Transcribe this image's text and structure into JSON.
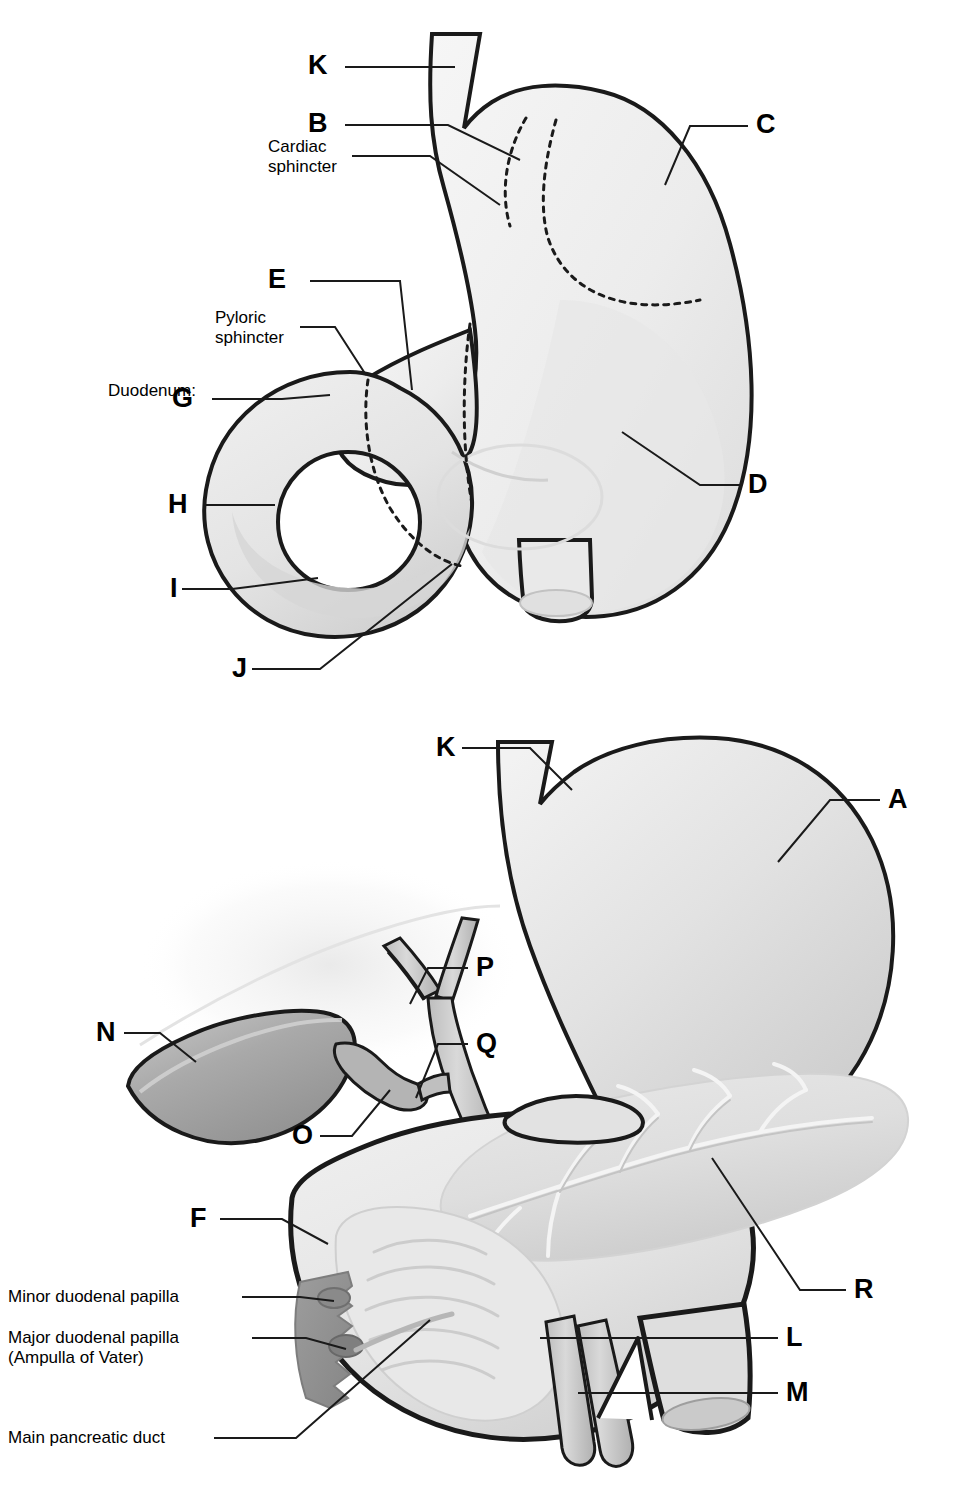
{
  "diagram": {
    "type": "anatomical-illustration",
    "style": "grayscale line art with airbrush shading",
    "background_color": "#ffffff",
    "outline_color": "#1a1a1a",
    "panels": [
      {
        "id": "upper",
        "name": "stomach-and-duodenum-exterior",
        "letters": [
          "K",
          "B",
          "C",
          "E",
          "G",
          "H",
          "I",
          "J",
          "D"
        ]
      },
      {
        "id": "lower",
        "name": "stomach-pancreas-biliary-cutaway",
        "letters": [
          "K",
          "A",
          "N",
          "O",
          "P",
          "Q",
          "F",
          "L",
          "M",
          "R"
        ]
      }
    ]
  },
  "upper_panel": {
    "letters": {
      "K": "K",
      "B": "B",
      "C": "C",
      "E": "E",
      "G": "G",
      "H": "H",
      "I": "I",
      "J": "J",
      "D": "D"
    },
    "text_labels": {
      "cardiac_sphincter": "Cardiac\nsphincter",
      "pyloric_sphincter": "Pyloric\nsphincter",
      "duodenum_heading": "Duodenum:"
    }
  },
  "lower_panel": {
    "letters": {
      "K": "K",
      "A": "A",
      "N": "N",
      "O": "O",
      "P": "P",
      "Q": "Q",
      "F": "F",
      "L": "L",
      "M": "M",
      "R": "R"
    },
    "text_labels": {
      "minor_duodenal_papilla": "Minor duodenal papilla",
      "major_duodenal_papilla": "Major duodenal papilla\n(Ampulla of Vater)",
      "main_pancreatic_duct": "Main pancreatic duct"
    }
  },
  "colors": {
    "outline": "#1a1a1a",
    "organ_light": "#eeeeee",
    "organ_mid": "#d8d8d8",
    "organ_shadow": "#bdbdbd",
    "gallbladder": "#a8a8a8",
    "papilla_dark": "#8e8e8e",
    "leader_line": "#1a1a1a",
    "text": "#000000"
  }
}
